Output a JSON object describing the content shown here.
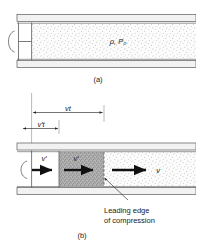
{
  "figure": {
    "panel_a": {
      "label": "(a)",
      "gas_label": "ρ, P₀",
      "piston_handle_icon": "c-handle-icon"
    },
    "dimensions": {
      "outer": "vt",
      "inner": "v′t"
    },
    "panel_b": {
      "label": "(b)",
      "piston_velocity": "v′",
      "compressed_velocity": "v′",
      "wave_velocity": "v",
      "annotation_line1": "Leading edge",
      "annotation_line2": "of compression"
    },
    "colors": {
      "wall_fill": "#f2f2f2",
      "wall_stroke": "#5a5a5a",
      "gas_fill": "#fbfbfb",
      "compressed_fill": "#b9b9b9",
      "arrow": "#111111",
      "text": "#1a1a1a"
    }
  }
}
